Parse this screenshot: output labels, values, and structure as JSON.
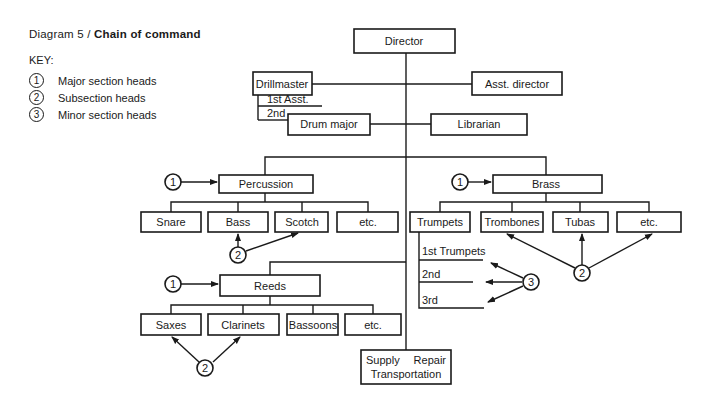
{
  "title": {
    "prefix": "Diagram 5 /",
    "bold": "Chain of command"
  },
  "key": {
    "label": "KEY:",
    "items": [
      {
        "num": "1",
        "text": "Major section heads"
      },
      {
        "num": "2",
        "text": "Subsection heads"
      },
      {
        "num": "3",
        "text": "Minor section heads"
      }
    ]
  },
  "nodes": {
    "director": "Director",
    "drillmaster": "Drillmaster",
    "asst_director": "Asst. director",
    "first_asst": "1st Asst.",
    "second": "2nd",
    "drum_major": "Drum major",
    "librarian": "Librarian",
    "percussion": "Percussion",
    "brass": "Brass",
    "reeds": "Reeds",
    "percussion_children": [
      "Snare",
      "Bass",
      "Scotch",
      "etc."
    ],
    "brass_children": [
      "Trumpets",
      "Trombones",
      "Tubas",
      "etc."
    ],
    "reeds_children": [
      "Saxes",
      "Clarinets",
      "Bassoons",
      "etc."
    ],
    "trumpet_sections": [
      "1st Trumpets",
      "2nd",
      "3rd"
    ],
    "supply_line1a": "Supply",
    "supply_line1b": "Repair",
    "supply_line2": "Transportation"
  },
  "markers": {
    "one": "1",
    "two": "2",
    "three": "3"
  }
}
